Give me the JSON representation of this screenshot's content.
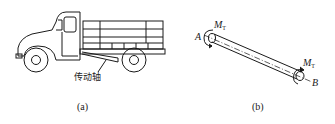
{
  "figure": {
    "panel_a": {
      "caption": "(a)",
      "subject": "truck",
      "label": "传动轴"
    },
    "panel_b": {
      "caption": "(b)",
      "subject": "shaft",
      "end_a_label": "A",
      "end_b_label": "B",
      "moment_symbol": "M",
      "moment_subscript": "T"
    },
    "colors": {
      "line": "#1a1a1a",
      "background": "#ffffff"
    }
  }
}
